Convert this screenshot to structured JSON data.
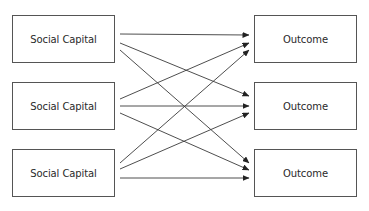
{
  "diagram": {
    "type": "bipartite-arrow-diagram",
    "sources": [
      {
        "id": "s1",
        "label": "Social Capital"
      },
      {
        "id": "s2",
        "label": "Social Capital"
      },
      {
        "id": "s3",
        "label": "Social Capital"
      }
    ],
    "targets": [
      {
        "id": "t1",
        "label": "Outcome"
      },
      {
        "id": "t2",
        "label": "Outcome"
      },
      {
        "id": "t3",
        "label": "Outcome"
      }
    ],
    "edges": [
      {
        "from": "s1",
        "to": "t1"
      },
      {
        "from": "s1",
        "to": "t2"
      },
      {
        "from": "s1",
        "to": "t3"
      },
      {
        "from": "s2",
        "to": "t1"
      },
      {
        "from": "s2",
        "to": "t2"
      },
      {
        "from": "s2",
        "to": "t3"
      },
      {
        "from": "s3",
        "to": "t1"
      },
      {
        "from": "s3",
        "to": "t2"
      },
      {
        "from": "s3",
        "to": "t3"
      }
    ],
    "colors": {
      "line": "#3a3a3a",
      "border": "#555555",
      "text": "#2a2a2a",
      "background": "#ffffff"
    }
  }
}
